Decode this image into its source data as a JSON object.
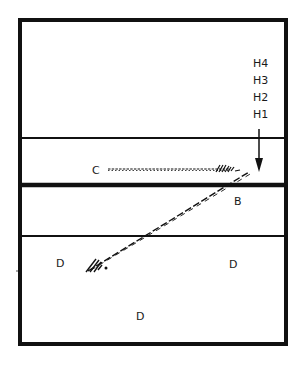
{
  "diagram": {
    "frame": {
      "x": 20,
      "y": 20,
      "width": 266,
      "height": 324,
      "stroke": "#111111"
    },
    "horizontal_lines": [
      {
        "name": "line-upper",
        "y": 138,
        "thickness": 2
      },
      {
        "name": "line-thick",
        "y": 185,
        "thickness": 4
      },
      {
        "name": "line-lower",
        "y": 236,
        "thickness": 2
      }
    ],
    "height_labels": [
      {
        "text": "H4",
        "x": 262,
        "y": 67
      },
      {
        "text": "H3",
        "x": 262,
        "y": 84
      },
      {
        "text": "H2",
        "x": 262,
        "y": 101
      },
      {
        "text": "H1",
        "x": 262,
        "y": 118
      }
    ],
    "arrow": {
      "x": 259,
      "y1": 129,
      "y2": 171
    },
    "region_labels": [
      {
        "text": "C",
        "x": 95,
        "y": 174
      },
      {
        "text": "B",
        "x": 237,
        "y": 205
      },
      {
        "text": "D",
        "x": 60,
        "y": 267
      },
      {
        "text": "D",
        "x": 233,
        "y": 268
      },
      {
        "text": "D",
        "x": 140,
        "y": 320
      }
    ],
    "hatched_paths": [
      {
        "name": "path-c-horizontal",
        "x1": 108,
        "y1": 169,
        "x2": 243,
        "y2": 169
      },
      {
        "name": "path-diagonal",
        "x1": 88,
        "y1": 271,
        "x2": 249,
        "y2": 172
      }
    ]
  }
}
